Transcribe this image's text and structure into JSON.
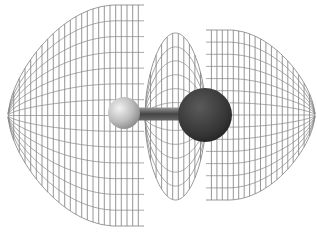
{
  "figure": {
    "title": "",
    "background": "#ffffff",
    "mesh_color": "#8a8a8a",
    "lobes": [
      {
        "id": "left-lobe",
        "x0": 8,
        "x1": 144,
        "top": 5,
        "bottom": 226,
        "cy": 115,
        "round_side": "left",
        "vlines": 24,
        "hlines": 14
      },
      {
        "id": "middle-lobe",
        "x0": 145,
        "x1": 206,
        "top": 33,
        "bottom": 200,
        "cy": 115,
        "round_side": "both",
        "vlines": 11,
        "hlines": 12
      },
      {
        "id": "right-lobe",
        "x0": 206,
        "x1": 315,
        "top": 30,
        "bottom": 200,
        "cy": 115,
        "round_side": "right",
        "vlines": 20,
        "hlines": 14
      }
    ],
    "atoms": [
      {
        "id": "small-atom",
        "cx": 124,
        "cy": 113,
        "r": 16,
        "shade": "light",
        "color": "#b8b8b8"
      },
      {
        "id": "large-atom",
        "cx": 205,
        "cy": 115,
        "r": 27,
        "shade": "dark",
        "color": "#3a3a3a"
      }
    ],
    "bond": {
      "x0": 138,
      "x1": 182,
      "y": 114,
      "thickness": 13,
      "color": "#555555"
    }
  }
}
